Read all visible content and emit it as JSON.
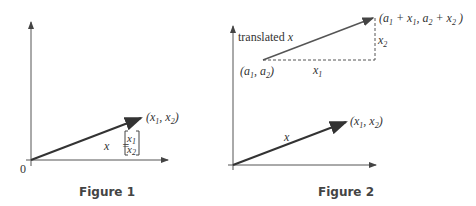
{
  "figure1": {
    "caption": "Figure 1",
    "origin_label": "0",
    "point_label": "(x1, x2)",
    "vector_equation": {
      "lhs": "x",
      "equals": "=",
      "entries": [
        "x1",
        "x2"
      ]
    }
  },
  "figure2": {
    "caption": "Figure 2",
    "translated_label": "translated x",
    "start_point": "(a1, a2)",
    "end_point": "(a1 + x1, a2 + x2)",
    "horizontal_leg": "x1",
    "vertical_leg": "x2",
    "vector_label": "x",
    "point_label": "(x1, x2)"
  }
}
